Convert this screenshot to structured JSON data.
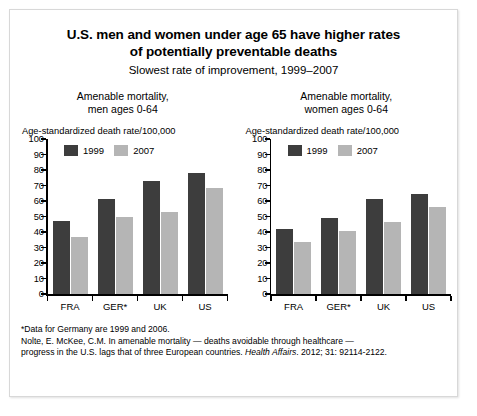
{
  "title": {
    "line1": "U.S. men and women under age 65 have higher rates",
    "line2": "of potentially preventable deaths",
    "subtitle": "Slowest rate of improvement, 1999–2007"
  },
  "legend": {
    "series1": "1999",
    "series2": "2007"
  },
  "colors": {
    "series1": "#3d3d3d",
    "series2": "#b5b5b5",
    "axis": "#000000",
    "background": "#ffffff",
    "frame": "#d8d8d8"
  },
  "panels": [
    {
      "title_line1": "Amenable mortality,",
      "title_line2": "men ages 0-64",
      "axis_caption": "Age-standardized death rate/100,000"
    },
    {
      "title_line1": "Amenable mortality,",
      "title_line2": "women ages 0-64",
      "axis_caption": "Age-standardized death rate/100,000"
    }
  ],
  "footnotes": {
    "line1": "*Data for Germany are 1999 and 2006.",
    "line2": "Nolte, E. McKee, C.M. In amenable mortality — deaths avoidable through healthcare —",
    "line3_a": "progress in the U.S. lags that of three European countries. ",
    "line3_journal": "Health Affairs",
    "line3_b": ". 2012; 31: 92114-2122."
  },
  "chart_data": [
    {
      "type": "bar",
      "title": "Amenable mortality, men ages 0-64",
      "xlabel": "",
      "ylabel": "Age-standardized death rate/100,000",
      "ylim": [
        0,
        100
      ],
      "yticks": [
        0,
        10,
        20,
        30,
        40,
        50,
        60,
        70,
        80,
        90,
        100
      ],
      "grid": false,
      "legend_position": "top-left-inside",
      "categories": [
        "FRA",
        "GER*",
        "UK",
        "US"
      ],
      "series": [
        {
          "name": "1999",
          "values": [
            47,
            61,
            73,
            78
          ]
        },
        {
          "name": "2007",
          "values": [
            36.5,
            49.5,
            53,
            68.5
          ]
        }
      ]
    },
    {
      "type": "bar",
      "title": "Amenable mortality, women ages 0-64",
      "xlabel": "",
      "ylabel": "Age-standardized death rate/100,000",
      "ylim": [
        0,
        100
      ],
      "yticks": [
        0,
        10,
        20,
        30,
        40,
        50,
        60,
        70,
        80,
        90,
        100
      ],
      "grid": false,
      "legend_position": "top-left-inside",
      "categories": [
        "FRA",
        "GER*",
        "UK",
        "US"
      ],
      "series": [
        {
          "name": "1999",
          "values": [
            42,
            49,
            61,
            64.5
          ]
        },
        {
          "name": "2007",
          "values": [
            33.5,
            40.5,
            46.5,
            56
          ]
        }
      ]
    }
  ]
}
